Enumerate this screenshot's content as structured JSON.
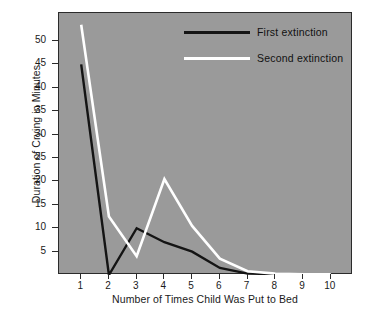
{
  "chart_data": {
    "type": "line",
    "title": "",
    "xlabel": "Number of Times Child Was Put to Bed",
    "ylabel": "Duration of Crying in Minutes",
    "x": [
      1,
      2,
      3,
      4,
      5,
      6,
      7,
      8,
      9,
      10
    ],
    "xtick_labels": [
      "1",
      "2",
      "3",
      "4",
      "5",
      "6",
      "7",
      "8",
      "9",
      "10"
    ],
    "ytick_labels": [
      "5",
      "10",
      "15",
      "20",
      "25",
      "30",
      "35",
      "40",
      "45",
      "50"
    ],
    "ytick_values": [
      5,
      10,
      15,
      20,
      25,
      30,
      35,
      40,
      45,
      50
    ],
    "xlim": [
      0.2,
      10.8
    ],
    "ylim": [
      0,
      56
    ],
    "grid": false,
    "legend_position": "top-right",
    "plot_background": "#9a9a9a",
    "series": [
      {
        "name": "First extinction",
        "color": "#141414",
        "values": [
          45,
          0,
          10,
          7,
          5,
          1.5,
          0.3,
          0.2,
          0.2,
          0.2
        ]
      },
      {
        "name": "Second extinction",
        "color": "#ffffff",
        "values": [
          53.5,
          12.5,
          4,
          20.5,
          10.5,
          3.5,
          0.8,
          0.3,
          0.2,
          0.2
        ]
      }
    ]
  },
  "legend": {
    "items": [
      {
        "label": "First extinction",
        "color": "#141414"
      },
      {
        "label": "Second extinction",
        "color": "#ffffff"
      }
    ]
  }
}
